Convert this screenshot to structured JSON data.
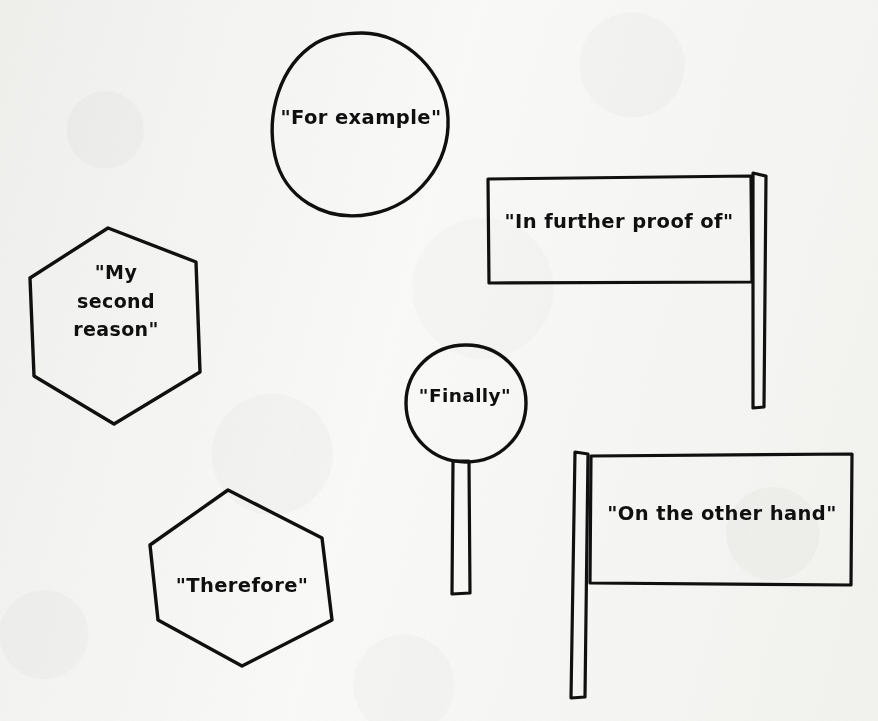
{
  "canvas": {
    "width": 878,
    "height": 721,
    "background_color": "#f9f9f8",
    "ink_color": "#101010",
    "style": "hand-drawn black ink on scanned white paper"
  },
  "shapes": [
    {
      "id": "for-example",
      "icon_name": "circle-shape",
      "shape": "circle",
      "text": "\"For example\"",
      "bounds": {
        "x": 272,
        "y": 33,
        "width": 178,
        "height": 182
      }
    },
    {
      "id": "my-second-reason",
      "icon_name": "hexagon-shape",
      "shape": "hexagon",
      "text": "\"My\nsecond\nreason\"",
      "bounds": {
        "x": 30,
        "y": 228,
        "width": 172,
        "height": 196
      }
    },
    {
      "id": "in-further-proof-of",
      "icon_name": "flag-shape",
      "shape": "flag",
      "pole_side": "right",
      "text": "\"In further proof of\"",
      "bounds": {
        "x": 488,
        "y": 178,
        "width": 278,
        "height": 230
      }
    },
    {
      "id": "finally",
      "icon_name": "lollipop-sign-shape",
      "shape": "circle-on-post",
      "text": "\"Finally\"",
      "bounds": {
        "x": 406,
        "y": 345,
        "width": 120,
        "height": 250
      }
    },
    {
      "id": "on-the-other-hand",
      "icon_name": "flag-shape",
      "shape": "flag",
      "pole_side": "left",
      "text": "\"On the other hand\"",
      "bounds": {
        "x": 573,
        "y": 452,
        "width": 282,
        "height": 248
      }
    },
    {
      "id": "therefore",
      "icon_name": "hexagon-shape",
      "shape": "hexagon",
      "text": "\"Therefore\"",
      "bounds": {
        "x": 150,
        "y": 490,
        "width": 182,
        "height": 176
      }
    }
  ]
}
